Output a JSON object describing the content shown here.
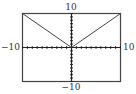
{
  "chart_data": {
    "type": "line",
    "title": "",
    "function": "y = |x|",
    "xlabel": "",
    "ylabel": "",
    "xlim": [
      -10,
      10
    ],
    "ylim": [
      -10,
      10
    ],
    "xscale": 1,
    "yscale": 1,
    "grid": false,
    "legend": null,
    "series": [
      {
        "name": "y = |x|",
        "x": [
          -10,
          0,
          10
        ],
        "y": [
          10,
          0,
          10
        ]
      }
    ],
    "window_labels": {
      "xmin": "−10",
      "xmax": "10",
      "ymin": "−10",
      "ymax": "10"
    },
    "colors": {
      "frame": "#444444",
      "axes": "#222222",
      "curve": "#444444"
    }
  }
}
